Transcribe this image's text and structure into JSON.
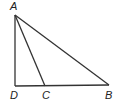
{
  "diagram": {
    "type": "geometry-triangle",
    "points": {
      "A": {
        "label": "A",
        "x": 15,
        "y": 15
      },
      "D": {
        "label": "D",
        "x": 15,
        "y": 86
      },
      "C": {
        "label": "C",
        "x": 45,
        "y": 86
      },
      "B": {
        "label": "B",
        "x": 109,
        "y": 86
      }
    },
    "segments": [
      "AD",
      "AC",
      "AB",
      "DB"
    ],
    "colors": {
      "line": "#333333",
      "background": "#ffffff"
    }
  }
}
